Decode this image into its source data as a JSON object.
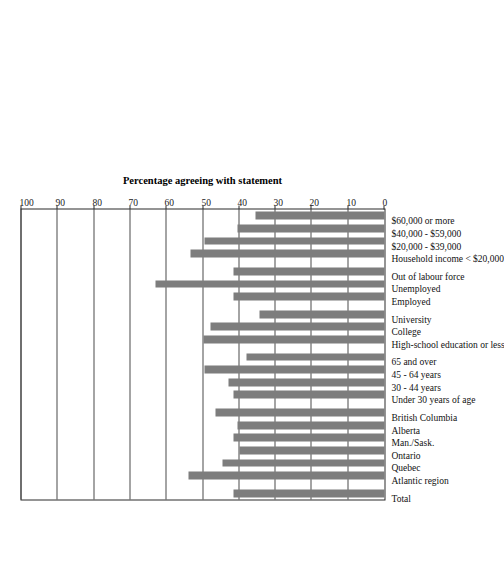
{
  "chart_data": {
    "type": "bar",
    "title": "",
    "subtitle": "",
    "orientation": "vertical-rotated",
    "xlabel": "",
    "ylabel": "Percentage agreeing with statement",
    "ylim": [
      0,
      100
    ],
    "ytick_labels": [
      "0",
      "10",
      "20",
      "30",
      "40",
      "50",
      "60",
      "70",
      "80",
      "90",
      "100"
    ],
    "yticks": [
      0,
      10,
      20,
      30,
      40,
      50,
      60,
      70,
      80,
      90,
      100
    ],
    "grid": true,
    "grid_axis": "y",
    "legend": false,
    "legend_position": "none",
    "bar_color": "#7d7d7d",
    "axis_color": "#2a2a2a",
    "categories": [
      "Total",
      "Atlantic region",
      "Quebec",
      "Ontario",
      "Man./Sask.",
      "Alberta",
      "British Columbia",
      "Under 30 years of age",
      "30 - 44 years",
      "45 - 64 years",
      "65 and over",
      "High-school education or less",
      "College",
      "University",
      "Employed",
      "Unemployed",
      "Out of labour force",
      "Household income < $20,000",
      "$20,000 - $39,000",
      "$40,000 - $59,000",
      "$60,000 or more"
    ],
    "values": [
      41.5,
      54.0,
      44.5,
      40.0,
      41.5,
      40.5,
      46.5,
      41.5,
      43.0,
      49.5,
      38.0,
      50.0,
      48.0,
      34.5,
      41.5,
      63.0,
      41.5,
      53.5,
      49.5,
      40.5,
      35.5
    ],
    "group_breaks": [
      1,
      7,
      11,
      14,
      17
    ],
    "groups": [
      {
        "name": "Total",
        "categories": [
          "Total"
        ]
      },
      {
        "name": "Region",
        "categories": [
          "Atlantic region",
          "Quebec",
          "Ontario",
          "Man./Sask.",
          "Alberta",
          "British Columbia"
        ]
      },
      {
        "name": "Age",
        "categories": [
          "Under 30 years of age",
          "30 - 44 years",
          "45 - 64 years",
          "65 and over"
        ]
      },
      {
        "name": "Education",
        "categories": [
          "High-school education or less",
          "College",
          "University"
        ]
      },
      {
        "name": "Labour force status",
        "categories": [
          "Employed",
          "Unemployed",
          "Out of labour force"
        ]
      },
      {
        "name": "Household income",
        "categories": [
          "Household income < $20,000",
          "$20,000 - $39,000",
          "$40,000 - $59,000",
          "$60,000 or more"
        ]
      }
    ]
  }
}
